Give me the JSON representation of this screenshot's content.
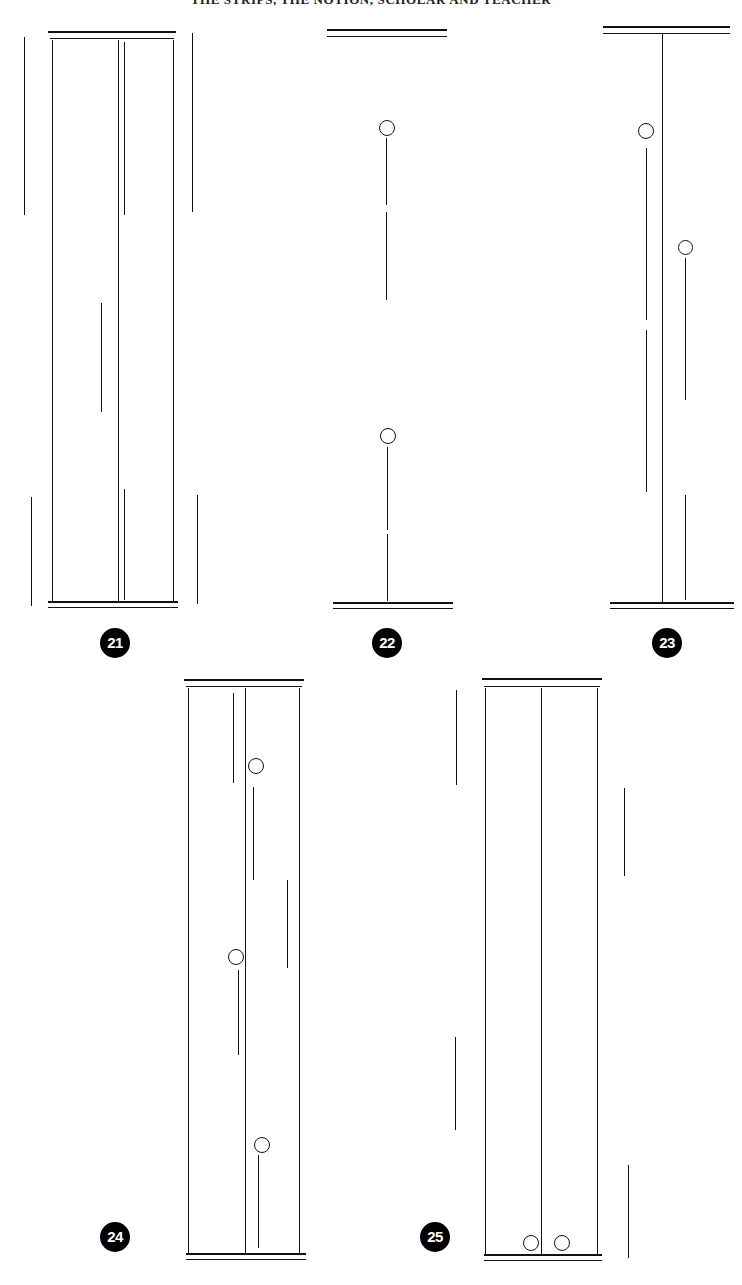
{
  "page": {
    "running_head": "THE STRIPS, THE NOTION, SCHOLAR AND TEACHER",
    "background_color": "#ffffff",
    "ink_color": "#111111",
    "badge_color": "#000000",
    "badge_text_color": "#ffffff",
    "width": 742,
    "height": 1285
  },
  "figures": [
    {
      "number": "21",
      "caption_label": "21",
      "type": "closed-strip",
      "badge": {
        "x": 100,
        "y": 628
      },
      "frame": {
        "left": 52,
        "right": 173,
        "top": 40,
        "bottom": 603
      },
      "top_rules": [
        {
          "x": 48,
          "y": 31,
          "width": 128
        },
        {
          "x": 50,
          "y": 38,
          "width": 124
        }
      ],
      "bottom_rules": [
        {
          "x": 48,
          "y": 601,
          "width": 130
        },
        {
          "x": 48,
          "y": 607,
          "width": 130
        }
      ],
      "inner_lines": [
        {
          "x": 118,
          "y1": 40,
          "y2": 603,
          "weight": "stem"
        },
        {
          "x": 124,
          "y1": 42,
          "y2": 215,
          "weight": "thin"
        },
        {
          "x": 101,
          "y1": 303,
          "y2": 412,
          "weight": "thin"
        },
        {
          "x": 124,
          "y1": 489,
          "y2": 600,
          "weight": "thin"
        }
      ],
      "outer_lines": [
        {
          "x": 24,
          "y1": 37,
          "y2": 215,
          "weight": "thin"
        },
        {
          "x": 31,
          "y1": 497,
          "y2": 606,
          "weight": "thin"
        },
        {
          "x": 192,
          "y1": 33,
          "y2": 212,
          "weight": "thin"
        },
        {
          "x": 197,
          "y1": 495,
          "y2": 604,
          "weight": "thin"
        }
      ],
      "circles": []
    },
    {
      "number": "22",
      "caption_label": "22",
      "type": "free-stems",
      "badge": {
        "x": 372,
        "y": 628
      },
      "top_rules": [
        {
          "x": 327,
          "y": 29,
          "width": 120
        },
        {
          "x": 327,
          "y": 36,
          "width": 120
        }
      ],
      "bottom_rules": [
        {
          "x": 333,
          "y": 602,
          "width": 120
        },
        {
          "x": 333,
          "y": 608,
          "width": 120
        }
      ],
      "inner_lines": [
        {
          "x": 386,
          "y1": 138,
          "y2": 205,
          "weight": "thin"
        },
        {
          "x": 386,
          "y1": 212,
          "y2": 300,
          "weight": "thin"
        },
        {
          "x": 387,
          "y1": 447,
          "y2": 530,
          "weight": "thin"
        },
        {
          "x": 387,
          "y1": 534,
          "y2": 601,
          "weight": "thin"
        }
      ],
      "outer_lines": [],
      "circles": [
        {
          "cx": 387,
          "cy": 128,
          "r": 8
        },
        {
          "cx": 388,
          "cy": 436,
          "r": 8
        }
      ]
    },
    {
      "number": "23",
      "caption_label": "23",
      "type": "stem-with-rules",
      "badge": {
        "x": 652,
        "y": 628
      },
      "top_rules": [
        {
          "x": 603,
          "y": 26,
          "width": 127
        },
        {
          "x": 603,
          "y": 33,
          "width": 127
        }
      ],
      "bottom_rules": [
        {
          "x": 610,
          "y": 602,
          "width": 124
        },
        {
          "x": 610,
          "y": 608,
          "width": 124
        }
      ],
      "inner_lines": [
        {
          "x": 662,
          "y1": 33,
          "y2": 603,
          "weight": "stem"
        },
        {
          "x": 646,
          "y1": 148,
          "y2": 320,
          "weight": "thin"
        },
        {
          "x": 646,
          "y1": 330,
          "y2": 492,
          "weight": "thin"
        },
        {
          "x": 685,
          "y1": 258,
          "y2": 400,
          "weight": "thin"
        },
        {
          "x": 685,
          "y1": 495,
          "y2": 600,
          "weight": "thin"
        }
      ],
      "outer_lines": [],
      "circles": [
        {
          "cx": 646,
          "cy": 131,
          "r": 8
        },
        {
          "cx": 685,
          "cy": 247,
          "r": 7.5
        }
      ]
    },
    {
      "number": "24",
      "caption_label": "24",
      "type": "closed-strip",
      "badge": {
        "x": 100,
        "y": 1222
      },
      "frame": {
        "left": 188,
        "right": 299,
        "top": 688,
        "bottom": 1255
      },
      "top_rules": [
        {
          "x": 184,
          "y": 679,
          "width": 120
        },
        {
          "x": 186,
          "y": 686,
          "width": 116
        }
      ],
      "bottom_rules": [
        {
          "x": 186,
          "y": 1253,
          "width": 120
        },
        {
          "x": 186,
          "y": 1259,
          "width": 120
        }
      ],
      "inner_lines": [
        {
          "x": 245,
          "y1": 688,
          "y2": 1255,
          "weight": "stem"
        },
        {
          "x": 233,
          "y1": 693,
          "y2": 783,
          "weight": "thin"
        },
        {
          "x": 253,
          "y1": 787,
          "y2": 880,
          "weight": "thin"
        },
        {
          "x": 287,
          "y1": 880,
          "y2": 968,
          "weight": "thin"
        },
        {
          "x": 238,
          "y1": 970,
          "y2": 1055,
          "weight": "thin"
        },
        {
          "x": 258,
          "y1": 1155,
          "y2": 1248,
          "weight": "thin"
        }
      ],
      "outer_lines": [],
      "circles": [
        {
          "cx": 256,
          "cy": 766,
          "r": 8
        },
        {
          "cx": 236,
          "cy": 957,
          "r": 8
        },
        {
          "cx": 262,
          "cy": 1145,
          "r": 8
        }
      ]
    },
    {
      "number": "25",
      "caption_label": "25",
      "type": "closed-strip",
      "badge": {
        "x": 420,
        "y": 1222
      },
      "frame": {
        "left": 485,
        "right": 597,
        "top": 688,
        "bottom": 1255
      },
      "top_rules": [
        {
          "x": 482,
          "y": 678,
          "width": 120
        },
        {
          "x": 484,
          "y": 686,
          "width": 116
        }
      ],
      "bottom_rules": [
        {
          "x": 484,
          "y": 1254,
          "width": 118
        },
        {
          "x": 484,
          "y": 1260,
          "width": 118
        }
      ],
      "inner_lines": [
        {
          "x": 541,
          "y1": 688,
          "y2": 1255,
          "weight": "stem"
        }
      ],
      "outer_lines": [
        {
          "x": 456,
          "y1": 690,
          "y2": 785,
          "weight": "thin"
        },
        {
          "x": 455,
          "y1": 1037,
          "y2": 1130,
          "weight": "thin"
        },
        {
          "x": 624,
          "y1": 788,
          "y2": 876,
          "weight": "thin"
        },
        {
          "x": 628,
          "y1": 1165,
          "y2": 1258,
          "weight": "thin"
        }
      ],
      "circles": [
        {
          "cx": 531,
          "cy": 1243,
          "r": 8
        },
        {
          "cx": 562,
          "cy": 1243,
          "r": 8
        }
      ]
    }
  ]
}
